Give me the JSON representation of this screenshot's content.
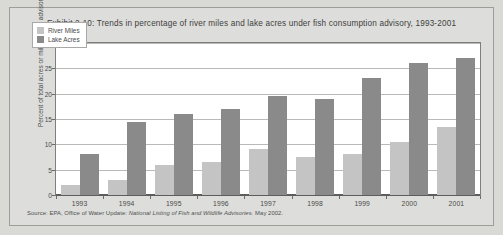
{
  "figure": {
    "title": "Exhibit 2-10: Trends in percentage of river miles and lake acres under fish consumption advisory, 1993-2001",
    "source_prefix": "Source: EPA, Office of Water Update:",
    "source_italic": "National Listing of Fish and Wildlife Advisories.",
    "source_suffix": "May 2002.",
    "panel_bg": "#dddedb",
    "plot_bg": "#ffffff",
    "frame_color": "#7e7f7c"
  },
  "chart_data": {
    "type": "bar",
    "title": "Exhibit 2-10: Trends in percentage of river miles and lake acres under fish consumption advisory, 1993-2001",
    "xlabel": "",
    "ylabel": "Percent of total acres or miles under advisory",
    "categories": [
      "1993",
      "1994",
      "1995",
      "1996",
      "1997",
      "1998",
      "1999",
      "2000",
      "2001"
    ],
    "series": [
      {
        "name": "River Miles",
        "color": "#c4c4c4",
        "values": [
          2,
          3,
          6,
          6.5,
          9,
          7.5,
          8,
          10.5,
          13.5
        ]
      },
      {
        "name": "Lake Acres",
        "color": "#8a8a8a",
        "values": [
          8,
          14.5,
          16,
          17,
          19.5,
          19,
          23,
          26,
          27
        ]
      }
    ],
    "ylim": [
      0,
      30
    ],
    "yticks": [
      0,
      5,
      10,
      15,
      20,
      25,
      30
    ],
    "ytick_labels": [
      "0",
      "5",
      "10",
      "15",
      "20",
      "25",
      "30"
    ],
    "grid": true,
    "grid_axis": "y",
    "legend_position": "upper-left-inside"
  }
}
